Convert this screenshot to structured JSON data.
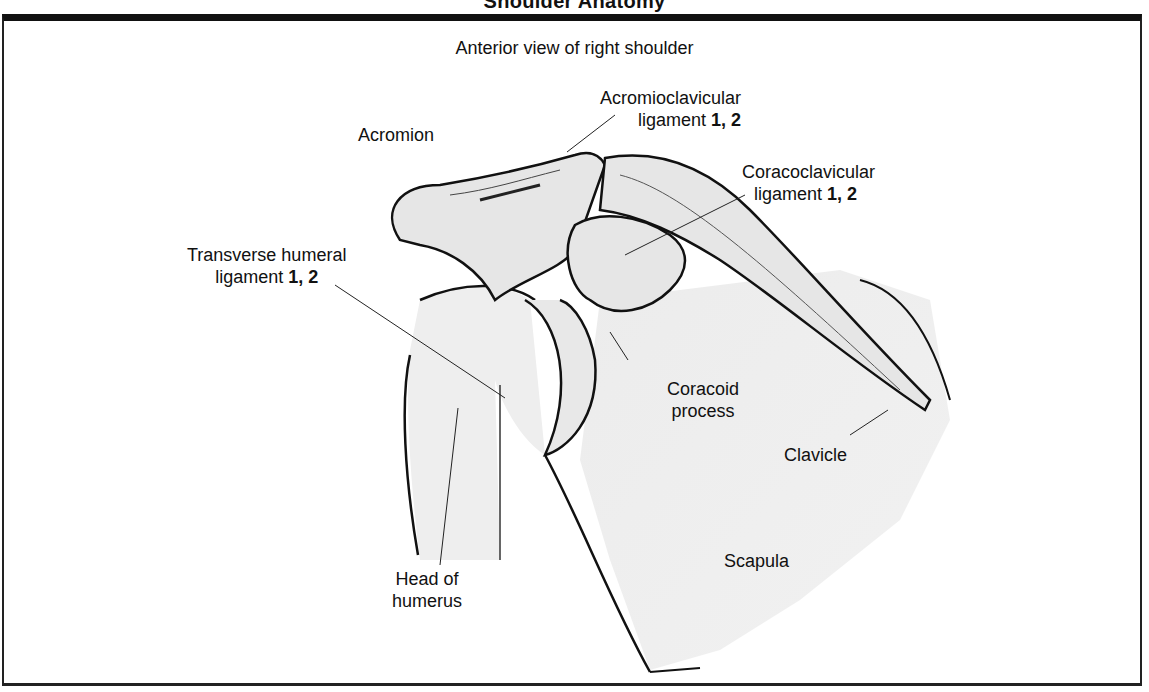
{
  "figure": {
    "title": "Shoulder Anatomy",
    "subtitle": "Anterior view of right shoulder"
  },
  "labels": {
    "acromion": "Acromion",
    "acromioclavicular_line1": "Acromioclavicular",
    "acromioclavicular_line2": "ligament",
    "acromioclavicular_ref": "1, 2",
    "coracoclavicular_line1": "Coracoclavicular",
    "coracoclavicular_line2": "ligament",
    "coracoclavicular_ref": "1, 2",
    "transverse_line1": "Transverse humeral",
    "transverse_line2": "ligament",
    "transverse_ref": "1, 2",
    "coracoid_line1": "Coracoid",
    "coracoid_line2": "process",
    "clavicle": "Clavicle",
    "scapula": "Scapula",
    "humerus_line1": "Head of",
    "humerus_line2": "humerus"
  }
}
